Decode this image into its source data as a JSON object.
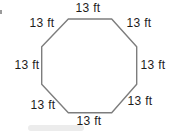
{
  "diagram": {
    "shape": "octagon",
    "stroke_color": "#7d7d7d",
    "text_color": "#1c1c1c",
    "labels": {
      "top": "13 ft",
      "top_right": "13 ft",
      "right": "13 ft",
      "bottom_right": "13 ft",
      "bottom": "13 ft",
      "bottom_left": "13 ft",
      "left": "13 ft",
      "top_left": "13 ft"
    }
  }
}
